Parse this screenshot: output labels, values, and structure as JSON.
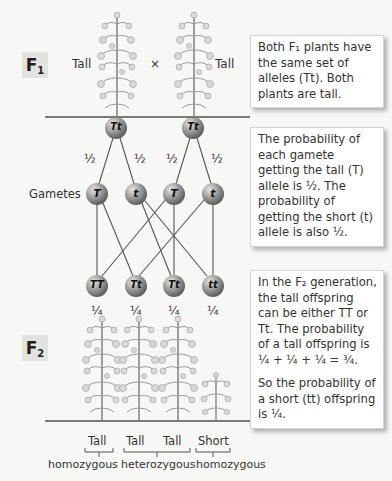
{
  "f1": {
    "label": "F",
    "sub": "1",
    "left_phenotype": "Tall",
    "cross_symbol": "×",
    "right_phenotype": "Tall",
    "note": "Both F₁ plants have the same set of alleles (Tt). Both plants are tall."
  },
  "parents": [
    {
      "genotype": "Tt"
    },
    {
      "genotype": "Tt"
    }
  ],
  "gametes": {
    "label": "Gametes",
    "probabilities": [
      "½",
      "½",
      "½",
      "½"
    ],
    "items": [
      {
        "allele": "T"
      },
      {
        "allele": "t"
      },
      {
        "allele": "T"
      },
      {
        "allele": "t"
      }
    ],
    "note": "The probability of each gamete getting the tall (T) allele is ½. The probability of getting the short (t) allele is also ½."
  },
  "f2": {
    "label": "F",
    "sub": "2",
    "offspring": [
      {
        "genotype": "TT",
        "probability": "¼",
        "phenotype": "Tall"
      },
      {
        "genotype": "Tt",
        "probability": "¼",
        "phenotype": "Tall"
      },
      {
        "genotype": "Tt",
        "probability": "¼",
        "phenotype": "Tall"
      },
      {
        "genotype": "tt",
        "probability": "¼",
        "phenotype": "Short"
      }
    ],
    "note_1": "In the F₂ generation, the tall offspring can be either TT or Tt. The probability of a tall offspring is ¼ + ¼ + ¼ = ¾.",
    "note_2": "So the probability of a short (tt) offspring is ¼.",
    "groups": [
      "homozygous",
      "heterozygous",
      "homozygous"
    ]
  },
  "colors": {
    "circle_dark": "#6e6e6e",
    "circle_light": "#d8d8d8",
    "line": "#555555",
    "background": "#f7f7f5"
  }
}
